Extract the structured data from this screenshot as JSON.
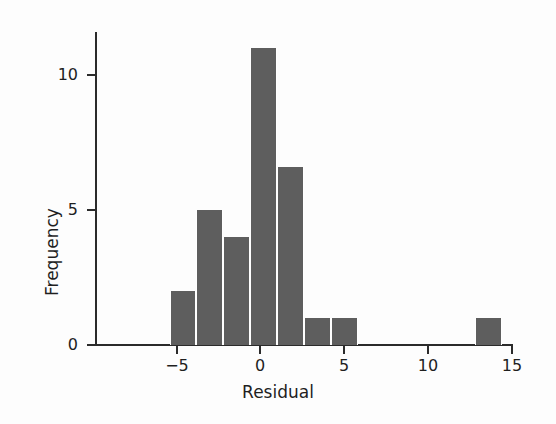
{
  "chart_data": {
    "type": "bar",
    "subtype": "histogram",
    "title": "",
    "xlabel": "Residual",
    "ylabel": "Frequency",
    "xlim": [
      -8.7,
      15.2
    ],
    "ylim": [
      0,
      11.6
    ],
    "grid": false,
    "legend": null,
    "bar_color": "#5e5e5e",
    "axis_color": "#2b2b2b",
    "bin_width": 1.62,
    "xticks": [
      -5,
      0,
      5,
      10,
      15
    ],
    "xtick_labels": [
      "−5",
      "0",
      "5",
      "10",
      "15"
    ],
    "yticks": [
      0,
      5,
      10
    ],
    "ytick_labels": [
      "0",
      "5",
      "10"
    ],
    "bins": [
      {
        "left": -5.45,
        "right": -3.83,
        "center": -4.64,
        "value": 2
      },
      {
        "left": -3.83,
        "right": -2.21,
        "center": -3.02,
        "value": 5
      },
      {
        "left": -2.21,
        "right": -0.59,
        "center": -1.4,
        "value": 4
      },
      {
        "left": -0.59,
        "right": 1.03,
        "center": 0.22,
        "value": 11
      },
      {
        "left": 1.03,
        "right": 2.65,
        "center": 1.84,
        "value": 6.6
      },
      {
        "left": 2.65,
        "right": 4.27,
        "center": 3.46,
        "value": 1
      },
      {
        "left": 4.27,
        "right": 5.89,
        "center": 5.08,
        "value": 1
      },
      {
        "left": 12.93,
        "right": 14.55,
        "center": 13.74,
        "value": 1
      }
    ],
    "categories": [
      "-4.64",
      "-3.02",
      "-1.40",
      "0.22",
      "1.84",
      "3.46",
      "5.08",
      "13.74"
    ],
    "values": [
      2,
      5,
      4,
      11,
      6.6,
      1,
      1,
      1
    ]
  },
  "axes": {
    "x": {
      "label": "Residual",
      "ticks": [
        {
          "value": -5,
          "label": "−5",
          "px": 177
        },
        {
          "value": 0,
          "label": "0",
          "px": 260
        },
        {
          "value": 5,
          "label": "5",
          "px": 343
        },
        {
          "value": 10,
          "label": "10",
          "px": 428
        },
        {
          "value": 15,
          "label": "15",
          "px": 512
        }
      ]
    },
    "y": {
      "label": "Frequency",
      "ticks": [
        {
          "value": 0,
          "label": "0",
          "px": 345
        },
        {
          "value": 5,
          "label": "5",
          "px": 210
        },
        {
          "value": 10,
          "label": "10",
          "px": 75
        }
      ]
    }
  }
}
